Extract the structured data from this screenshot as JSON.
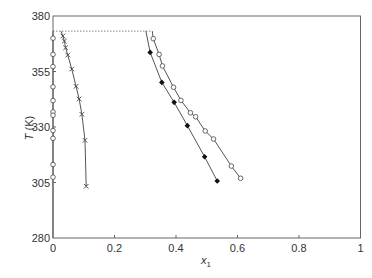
{
  "chart_data": {
    "type": "scatter",
    "title": "",
    "xlabel": "x",
    "xlabel_subscript": "1",
    "ylabel": "T (K)",
    "xlim": [
      0,
      1
    ],
    "ylim": [
      280,
      380
    ],
    "xticks": [
      0,
      0.2,
      0.4,
      0.6,
      0.8,
      1
    ],
    "xtick_labels": [
      "0",
      "0.2",
      "0.4",
      "0.6",
      "0.8",
      "1"
    ],
    "yticks": [
      280,
      305,
      330,
      355,
      380
    ],
    "ytick_labels": [
      "280",
      "305",
      "330",
      "355",
      "380"
    ],
    "grid": false,
    "legend": null,
    "reference_line": {
      "style": "dotted",
      "y": 373.2,
      "x": [
        0,
        0.32
      ]
    },
    "series": [
      {
        "name": "left-axis-circles",
        "marker": "open-circle",
        "line": true,
        "x": [
          0,
          0,
          0,
          0,
          0,
          0,
          0,
          0,
          0,
          0,
          0
        ],
        "y": [
          370.0,
          362.7,
          357.2,
          348.1,
          341.9,
          336.8,
          335.3,
          328.4,
          324.9,
          313.1,
          307.4
        ],
        "line_extent": {
          "x": [
            0,
            0
          ],
          "y": [
            280,
            373.2
          ]
        }
      },
      {
        "name": "crosses",
        "marker": "x",
        "line": true,
        "x": [
          0.032,
          0.037,
          0.041,
          0.048,
          0.061,
          0.075,
          0.085,
          0.094,
          0.104,
          0.108
        ],
        "y": [
          371.0,
          368.7,
          365.7,
          362.4,
          356.1,
          348.3,
          342.6,
          335.7,
          324.0,
          303.3
        ],
        "line_start": {
          "x": 0.026,
          "y": 373.2
        }
      },
      {
        "name": "filled-diamonds",
        "marker": "filled-diamond",
        "line": true,
        "x": [
          0.316,
          0.354,
          0.394,
          0.437,
          0.493,
          0.534
        ],
        "y": [
          363.6,
          350.1,
          341.1,
          330.6,
          316.6,
          305.7
        ],
        "line_start": {
          "x": 0.302,
          "y": 373.2
        }
      },
      {
        "name": "open-circles",
        "marker": "open-circle",
        "line": true,
        "x": [
          0.326,
          0.345,
          0.356,
          0.392,
          0.416,
          0.447,
          0.464,
          0.495,
          0.522,
          0.58,
          0.61
        ],
        "y": [
          369.8,
          362.7,
          357.5,
          347.9,
          342.0,
          336.4,
          334.6,
          328.2,
          324.6,
          312.4,
          306.9
        ],
        "line_start": {
          "x": 0.323,
          "y": 373.2
        }
      }
    ]
  },
  "colors": {
    "axis": "#555555",
    "line": "#555555",
    "marker": "#444444",
    "diamond_fill": "#111111",
    "background": "#ffffff"
  }
}
